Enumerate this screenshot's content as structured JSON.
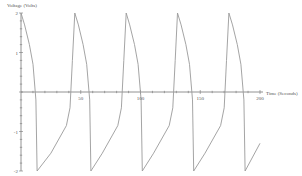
{
  "chart_data": {
    "type": "line",
    "title": "",
    "xlabel": "Time (Seconds)",
    "ylabel": "Voltage (Volts)",
    "xlim": [
      0,
      200
    ],
    "ylim": [
      -2,
      2
    ],
    "grid": false,
    "x_ticks": [
      50,
      100,
      150,
      200
    ],
    "x_tick_labels": [
      "50",
      "100",
      "150",
      "200"
    ],
    "y_ticks": [
      2,
      1,
      -1,
      -2
    ],
    "y_tick_labels": [
      "2",
      "1",
      "-1",
      "-2"
    ],
    "series": [
      {
        "name": "Voltage",
        "color": "#9a9a9a",
        "x": [
          0,
          3,
          7,
          10,
          12.5,
          13.5,
          25,
          38,
          41,
          43,
          45,
          48,
          52,
          55,
          57.5,
          58.5,
          68,
          81,
          84,
          86,
          88,
          91,
          95,
          98,
          100.5,
          101.5,
          111,
          124,
          127,
          129,
          131,
          134,
          138,
          141,
          143.5,
          144.5,
          154,
          167,
          170,
          172,
          174,
          177,
          181,
          184,
          186.5,
          187.5,
          200
        ],
        "y": [
          2,
          1.7,
          1.2,
          0.7,
          -0.2,
          -2,
          -1.55,
          -0.85,
          -0.4,
          0.8,
          2,
          1.7,
          1.2,
          0.7,
          -0.2,
          -2,
          -1.55,
          -0.85,
          -0.4,
          0.8,
          2,
          1.7,
          1.2,
          0.7,
          -0.2,
          -2,
          -1.55,
          -0.85,
          -0.4,
          0.8,
          2,
          1.7,
          1.2,
          0.7,
          -0.2,
          -2,
          -1.55,
          -0.85,
          -0.4,
          0.8,
          2,
          1.7,
          1.2,
          0.7,
          -0.2,
          -2,
          -1.3
        ]
      }
    ]
  }
}
